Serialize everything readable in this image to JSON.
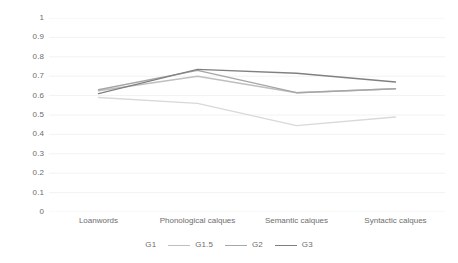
{
  "chart_data": {
    "type": "line",
    "title": "",
    "xlabel": "",
    "ylabel": "",
    "categories": [
      "Loanwords",
      "Phonological calques",
      "Semantic calques",
      "Syntactic calques"
    ],
    "series": [
      {
        "name": "G1",
        "values": [
          0.59,
          0.56,
          0.445,
          0.49
        ],
        "color": "#d9d9d9"
      },
      {
        "name": "G1.5",
        "values": [
          0.625,
          0.7,
          0.615,
          0.635
        ],
        "color": "#bfbfbf"
      },
      {
        "name": "G2",
        "values": [
          0.63,
          0.73,
          0.615,
          0.635
        ],
        "color": "#a6a6a6"
      },
      {
        "name": "G3",
        "values": [
          0.61,
          0.735,
          0.715,
          0.67
        ],
        "color": "#808080"
      }
    ],
    "ylim": [
      0,
      1
    ],
    "ytick_labels": [
      "1",
      "0.9",
      "0.8",
      "0.7",
      "0.6",
      "0.5",
      "0.4",
      "0.3",
      "0.2",
      "0.1",
      "0"
    ],
    "ytick_values": [
      1,
      0.9,
      0.8,
      0.7,
      0.6,
      0.5,
      0.4,
      0.3,
      0.2,
      0.1,
      0
    ],
    "grid": true,
    "grid_color": "#f2f2f2",
    "legend_position": "bottom",
    "legend_entries": [
      "G1",
      "G1.5",
      "G2",
      "G3"
    ],
    "axis_text_color": "#6d6d6d"
  }
}
